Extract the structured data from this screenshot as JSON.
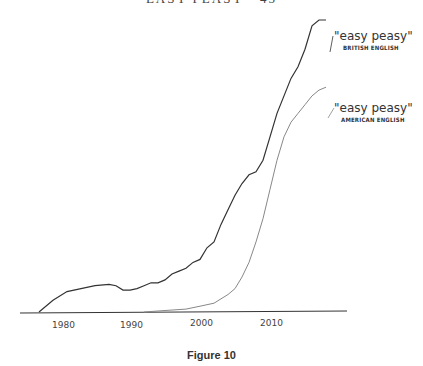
{
  "header_text": "EASY PEASY · 45",
  "caption": "Figure 10",
  "chart_data": {
    "type": "line",
    "title": "",
    "xlabel": "",
    "ylabel": "",
    "x_ticks": [
      "1980",
      "1990",
      "2000",
      "2010"
    ],
    "xlim": [
      1976,
      2019
    ],
    "ylim": [
      0,
      100
    ],
    "grid": false,
    "legend_position": "inline-right",
    "series": [
      {
        "name": "\"easy peasy\" BRITISH ENGLISH",
        "label_main": "\"easy peasy\"",
        "label_sub": "BRITISH ENGLISH",
        "color": "#333333",
        "x": [
          1977,
          1979,
          1981,
          1983,
          1985,
          1987,
          1988,
          1989,
          1990,
          1991,
          1992,
          1993,
          1994,
          1995,
          1996,
          1997,
          1998,
          1999,
          2000,
          2001,
          2002,
          2003,
          2004,
          2005,
          2006,
          2007,
          2008,
          2009,
          2010,
          2011,
          2012,
          2013,
          2014,
          2015,
          2016,
          2017,
          2018
        ],
        "values": [
          0,
          4,
          7,
          8,
          9,
          9.5,
          9,
          7.5,
          7.5,
          8,
          9,
          10,
          10,
          11,
          13,
          14,
          15,
          17,
          18,
          22,
          24,
          30,
          35,
          40,
          44,
          47,
          48,
          52,
          60,
          68,
          74,
          80,
          84,
          90,
          98,
          100,
          100
        ]
      },
      {
        "name": "\"easy peasy\" AMERICAN ENGLISH",
        "label_main": "\"easy peasy\"",
        "label_sub": "AMERICAN ENGLISH",
        "color": "#888888",
        "x": [
          1992,
          1995,
          1998,
          2000,
          2002,
          2004,
          2005,
          2006,
          2007,
          2008,
          2009,
          2010,
          2011,
          2012,
          2013,
          2014,
          2015,
          2016,
          2017,
          2018
        ],
        "values": [
          0,
          0.5,
          1,
          2,
          3,
          6,
          8,
          12,
          17,
          24,
          32,
          42,
          52,
          60,
          65,
          68,
          71,
          74,
          76,
          77
        ]
      },
      {
        "name": "baseline",
        "color": "#333333",
        "x": [
          1974,
          2019
        ],
        "values": [
          0,
          0
        ]
      }
    ]
  }
}
